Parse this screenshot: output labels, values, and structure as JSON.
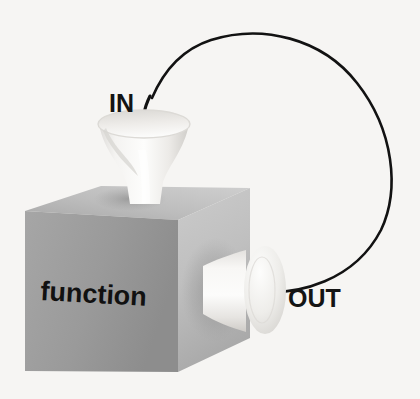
{
  "diagram": {
    "type": "function-machine-flow",
    "background_color": "#f6f5f3",
    "box": {
      "label": "function",
      "label_color": "#111111",
      "face_colors": {
        "top": "#b9b9b9",
        "front": "#9d9d9d",
        "right": "#bdbdbd"
      }
    },
    "input": {
      "label": "IN",
      "label_color": "#141414",
      "funnel_color": "#f2f1ef",
      "icon": "funnel-icon"
    },
    "output": {
      "label": "OUT",
      "label_color": "#141414",
      "funnel_color": "#f0efed",
      "icon": "funnel-icon"
    },
    "flow": {
      "arc_color": "#121212",
      "arrow_icon": "arrow-down-icon",
      "direction": "out-to-in-loop"
    }
  }
}
